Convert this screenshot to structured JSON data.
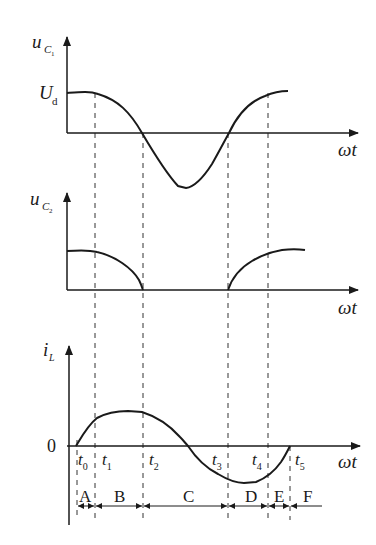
{
  "figure": {
    "plots": [
      {
        "id": "uc1",
        "y_label": "u",
        "y_label_sub": "C",
        "y_label_subsub": "1",
        "level_label": "U",
        "level_label_sub": "d",
        "x_label": "ωt"
      },
      {
        "id": "uc2",
        "y_label": "u",
        "y_label_sub": "C",
        "y_label_subsub": "2",
        "x_label": "ωt"
      },
      {
        "id": "iL",
        "y_label": "i",
        "y_label_sub": "L",
        "origin_label": "0",
        "x_label": "ωt"
      }
    ],
    "time_marks": [
      {
        "label": "t",
        "sub": "0"
      },
      {
        "label": "t",
        "sub": "1"
      },
      {
        "label": "t",
        "sub": "2"
      },
      {
        "label": "t",
        "sub": "3"
      },
      {
        "label": "t",
        "sub": "4"
      },
      {
        "label": "t",
        "sub": "5"
      }
    ],
    "intervals": [
      "A",
      "B",
      "C",
      "D",
      "E",
      "F"
    ]
  }
}
